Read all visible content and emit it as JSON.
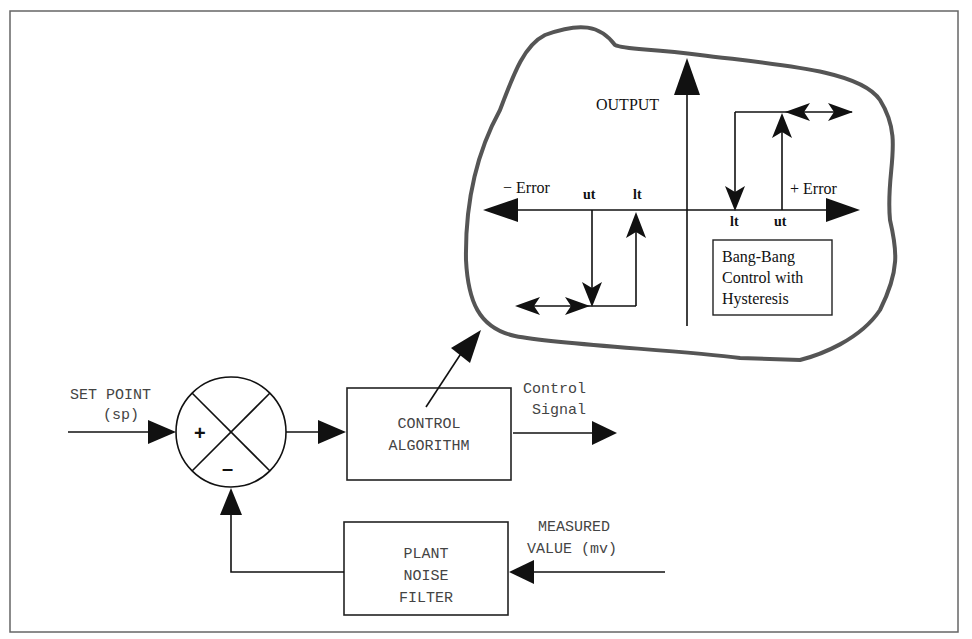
{
  "diagram": {
    "summing_junction": {
      "plus_sign": "+",
      "minus_sign": "–"
    },
    "inputs": {
      "set_point_line1": "SET POINT",
      "set_point_line2": "(sp)",
      "measured_value_line1": "MEASURED",
      "measured_value_line2": "VALUE (mv)"
    },
    "blocks": {
      "control_algorithm_line1": "CONTROL",
      "control_algorithm_line2": "ALGORITHM",
      "filter_line1": "PLANT",
      "filter_line2": "NOISE",
      "filter_line3": "FILTER"
    },
    "outputs": {
      "control_signal_line1": "Control",
      "control_signal_line2": "Signal"
    },
    "inset": {
      "y_axis_label": "OUTPUT",
      "neg_error_label": "− Error",
      "pos_error_label": "+ Error",
      "left_ut": "ut",
      "left_lt": "lt",
      "right_lt": "lt",
      "right_ut": "ut",
      "caption_line1": "Bang-Bang",
      "caption_line2": "Control with",
      "caption_line3": "Hysteresis"
    },
    "colors": {
      "line": "#111111",
      "blob_outline": "#555555",
      "frame": "#666666",
      "mono_text": "#444444"
    }
  }
}
